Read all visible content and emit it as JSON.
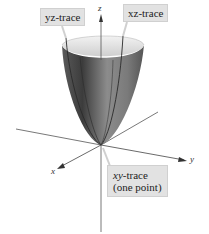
{
  "figure": {
    "axes": {
      "x_label": "x",
      "y_label": "y",
      "z_label": "z"
    },
    "callouts": {
      "yz_trace": "yz-trace",
      "xz_trace": "xz-trace",
      "xy_trace_line1_var": "xy",
      "xy_trace_line1_rest": "-trace",
      "xy_trace_line2": "(one point)"
    },
    "colors": {
      "background": "#ffffff",
      "callout_fill": "#e2e2e2",
      "surface_dark": "#3a3a3a",
      "surface_mid": "#8a8a8a",
      "surface_light": "#e8e8e8",
      "axis": "#444444"
    }
  }
}
